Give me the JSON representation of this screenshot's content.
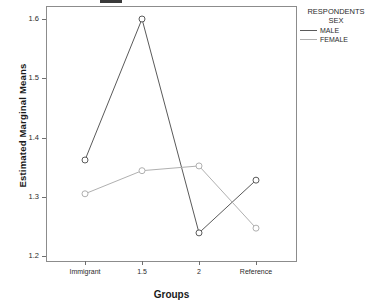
{
  "chart_data": {
    "type": "line",
    "title": "",
    "xlabel": "Groups",
    "ylabel": "Estimated Marginal Means",
    "categories": [
      "Immigrant",
      "1.5",
      "2",
      "Reference"
    ],
    "ylim": [
      1.2,
      1.6
    ],
    "yticks": [
      "1.2",
      "1.3",
      "1.4",
      "1.5",
      "1.6"
    ],
    "grid": false,
    "legend_position": "right",
    "legend_title": "RESPONDENTS SEX",
    "series": [
      {
        "name": "MALE",
        "color": "#5a5a5a",
        "values": [
          1.362,
          1.6,
          1.239,
          1.328
        ]
      },
      {
        "name": "FEMALE",
        "color": "#b0b0b0",
        "values": [
          1.305,
          1.344,
          1.352,
          1.247
        ]
      }
    ]
  },
  "legend": {
    "title_line1": "RESPONDENTS",
    "title_line2": "SEX",
    "entries": [
      {
        "label": "MALE"
      },
      {
        "label": "FEMALE"
      }
    ]
  },
  "axes": {
    "y_title": "Estimated Marginal Means",
    "x_title": "Groups",
    "y_tick_labels": [
      "1.6",
      "1.5",
      "1.4",
      "1.3",
      "1.2"
    ],
    "x_tick_labels": [
      "Immigrant",
      "1.5",
      "2",
      "Reference"
    ]
  }
}
